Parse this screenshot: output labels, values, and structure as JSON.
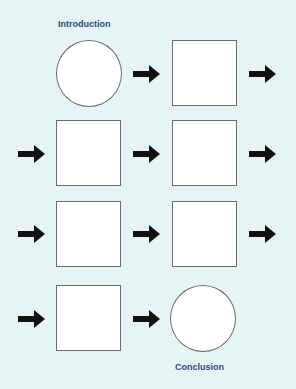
{
  "labels": {
    "start": "Introduction",
    "end": "Conclusion"
  },
  "colors": {
    "background": "#e6f4f4",
    "label": "#2a4a80",
    "shape_fill": "#ffffff",
    "shape_border": "#6b6b6b",
    "arrow": "#111111"
  },
  "flow": [
    {
      "row": 1,
      "shapes": [
        "circle",
        "square"
      ],
      "arrows": [
        "between",
        "right"
      ]
    },
    {
      "row": 2,
      "shapes": [
        "square",
        "square"
      ],
      "arrows": [
        "left",
        "between",
        "right"
      ]
    },
    {
      "row": 3,
      "shapes": [
        "square",
        "square"
      ],
      "arrows": [
        "left",
        "between",
        "right"
      ]
    },
    {
      "row": 4,
      "shapes": [
        "square",
        "circle"
      ],
      "arrows": [
        "left",
        "between"
      ]
    }
  ]
}
